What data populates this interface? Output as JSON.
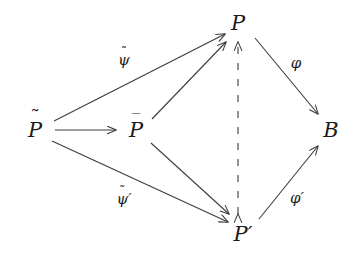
{
  "figure": {
    "type": "commutative-diagram",
    "background_color": "#ffffff",
    "stroke_color": "#3c3c3c",
    "text_color": "#1a1a1a",
    "width": 359,
    "height": 255
  },
  "nodes": [
    {
      "id": "p-tilde",
      "base": "P",
      "accent": "tilde",
      "prime": "",
      "display": "P̃",
      "x": 35,
      "y": 130
    },
    {
      "id": "p-bar",
      "base": "P",
      "accent": "bar",
      "prime": "",
      "display": "P̄",
      "x": 136,
      "y": 130
    },
    {
      "id": "p",
      "base": "P",
      "accent": "none",
      "prime": "",
      "display": "P",
      "x": 238,
      "y": 23
    },
    {
      "id": "p-prime",
      "base": "P",
      "accent": "none",
      "prime": "′",
      "display": "P′",
      "x": 243,
      "y": 234
    },
    {
      "id": "b",
      "base": "B",
      "accent": "none",
      "prime": "",
      "display": "B",
      "x": 331,
      "y": 130
    }
  ],
  "edges": [
    {
      "id": "edge-ptilde-pbar",
      "from": "p-tilde",
      "to": "p-bar",
      "style": "solid",
      "arrowheads": "end",
      "label": ""
    },
    {
      "id": "edge-ptilde-p",
      "from": "p-tilde",
      "to": "p",
      "style": "solid",
      "arrowheads": "end",
      "label": "ψ̃",
      "label_base": "ψ",
      "label_accent": "tilde",
      "label_prime": "",
      "label_x": 124,
      "label_y": 60
    },
    {
      "id": "edge-ptilde-pprime",
      "from": "p-tilde",
      "to": "p-prime",
      "style": "solid",
      "arrowheads": "end",
      "label": "ψ̃′",
      "label_base": "ψ",
      "label_accent": "tilde",
      "label_prime": "′",
      "label_x": 124,
      "label_y": 199
    },
    {
      "id": "edge-pbar-p",
      "from": "p-bar",
      "to": "p",
      "style": "solid",
      "arrowheads": "end",
      "label": ""
    },
    {
      "id": "edge-pbar-pprime",
      "from": "p-bar",
      "to": "p-prime",
      "style": "solid",
      "arrowheads": "end",
      "label": ""
    },
    {
      "id": "edge-p-b",
      "from": "p",
      "to": "b",
      "style": "solid",
      "arrowheads": "end",
      "label": "φ",
      "label_base": "φ",
      "label_accent": "none",
      "label_prime": "",
      "label_x": 296,
      "label_y": 63
    },
    {
      "id": "edge-pprime-b",
      "from": "p-prime",
      "to": "b",
      "style": "solid",
      "arrowheads": "end",
      "label": "φ′",
      "label_base": "φ",
      "label_accent": "none",
      "label_prime": "′",
      "label_x": 297,
      "label_y": 198
    },
    {
      "id": "edge-p-pprime-dashed",
      "from": "p",
      "to": "p-prime",
      "style": "dashed",
      "arrowheads": "both",
      "label": ""
    }
  ],
  "labels": {
    "psi_tilde": "ψ̃",
    "psi_tilde_prime": "ψ̃′",
    "phi": "φ",
    "phi_prime": "φ′",
    "node_p_tilde": "P̃",
    "node_p_bar": "P̄",
    "node_p": "P",
    "node_p_prime": "P′",
    "node_b": "B"
  },
  "glyphs": {
    "tilde_accent": "˜",
    "bar_accent": "‾",
    "prime": "′",
    "psi": "ψ",
    "phi": "φ"
  }
}
